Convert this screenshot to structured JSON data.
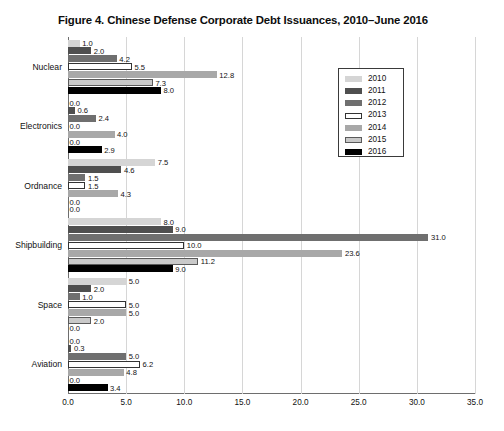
{
  "chart_data": {
    "type": "bar",
    "orientation": "horizontal",
    "title": "Figure 4. Chinese Defense Corporate Debt Issuances, 2010–June 2016",
    "xlabel": "",
    "ylabel": "",
    "xlim": [
      0.0,
      35.0
    ],
    "xticks": [
      "0.0",
      "5.0",
      "10.0",
      "15.0",
      "20.0",
      "25.0",
      "30.0",
      "35.0"
    ],
    "xtick_values": [
      0,
      5,
      10,
      15,
      20,
      25,
      30,
      35
    ],
    "grid": "vertical",
    "legend_position": "upper-right-inside",
    "categories": [
      "Nuclear",
      "Electronics",
      "Ordnance",
      "Shipbuilding",
      "Space",
      "Aviation"
    ],
    "series": [
      {
        "name": "2010",
        "color": "#d5d5d5",
        "border": "#d5d5d5",
        "values": [
          1.0,
          0.0,
          7.5,
          8.0,
          5.0,
          0.0
        ],
        "labels": [
          "1.0",
          "0.0",
          "7.5",
          "8.0",
          "5.0",
          "0.0"
        ]
      },
      {
        "name": "2011",
        "color": "#4f4f4f",
        "border": "#4f4f4f",
        "values": [
          2.0,
          0.6,
          4.6,
          9.0,
          2.0,
          0.3
        ],
        "labels": [
          "2.0",
          "0.6",
          "4.6",
          "9.0",
          "2.0",
          "0.3"
        ]
      },
      {
        "name": "2012",
        "color": "#6f6f6f",
        "border": "#6f6f6f",
        "values": [
          4.2,
          2.4,
          1.5,
          31.0,
          1.0,
          5.0
        ],
        "labels": [
          "4.2",
          "2.4",
          "1.5",
          "31.0",
          "1.0",
          "5.0"
        ]
      },
      {
        "name": "2013",
        "color": "#ffffff",
        "border": "#333333",
        "values": [
          5.5,
          0.0,
          1.5,
          10.0,
          5.0,
          6.2
        ],
        "labels": [
          "5.5",
          "0.0",
          "1.5",
          "10.0",
          "5.0",
          "6.2"
        ]
      },
      {
        "name": "2014",
        "color": "#a8a8a8",
        "border": "#a8a8a8",
        "values": [
          12.8,
          4.0,
          4.3,
          23.6,
          5.0,
          4.8
        ],
        "labels": [
          "12.8",
          "4.0",
          "4.3",
          "23.6",
          "5.0",
          "4.8"
        ]
      },
      {
        "name": "2015",
        "color": "#c9c9c9",
        "border": "#5a5a5a",
        "values": [
          7.3,
          0.0,
          0.0,
          11.2,
          2.0,
          0.0
        ],
        "labels": [
          "7.3",
          "0.0",
          "0.0",
          "11.2",
          "2.0",
          "0.0"
        ]
      },
      {
        "name": "2016",
        "color": "#000000",
        "border": "#000000",
        "values": [
          8.0,
          2.9,
          0.0,
          9.0,
          0.0,
          3.4
        ],
        "labels": [
          "8.0",
          "2.9",
          "0.0",
          "9.0",
          "0.0",
          "3.4"
        ]
      }
    ]
  }
}
